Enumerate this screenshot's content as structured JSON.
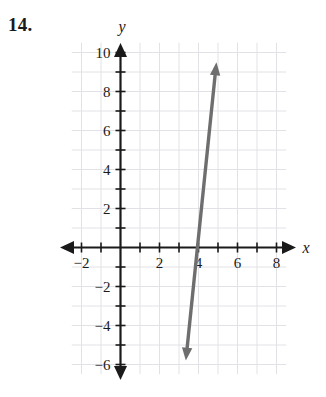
{
  "problem": {
    "number_label": "14."
  },
  "chart_data": {
    "type": "line",
    "title": "",
    "xlabel": "x",
    "ylabel": "y",
    "xlim": [
      -2.6,
      8.6
    ],
    "ylim": [
      -6.6,
      10.6
    ],
    "grid": true,
    "grid_step": 1,
    "grid_color": "#e2e2e6",
    "axis_color": "#1a1a1a",
    "line_color": "#6e6e6e",
    "x_tick_labels": [
      "-2",
      "2",
      "4",
      "6",
      "8"
    ],
    "x_tick_values": [
      -2,
      2,
      4,
      6,
      8
    ],
    "y_tick_labels": [
      "10",
      "8",
      "6",
      "4",
      "2",
      "-2",
      "-4",
      "-6"
    ],
    "y_tick_values": [
      10,
      8,
      6,
      4,
      2,
      -2,
      -4,
      -6
    ],
    "x_minor_ticks": [
      -2,
      -1,
      1,
      2,
      3,
      4,
      5,
      6,
      7,
      8
    ],
    "y_minor_ticks": [
      1,
      3,
      5,
      7,
      9,
      -1,
      -3,
      -5
    ],
    "series": [
      {
        "name": "line",
        "kind": "double-arrow-line",
        "x_intercept": 4,
        "slope": 10,
        "equation": "y = 10x - 40",
        "point_a": [
          3.35,
          -5.8
        ],
        "point_b": [
          4.92,
          9.5
        ],
        "arrow_start": true,
        "arrow_end": true
      }
    ],
    "x_axis_arrows": [
      "left",
      "right"
    ],
    "y_axis_arrows": [
      "up",
      "down"
    ]
  }
}
